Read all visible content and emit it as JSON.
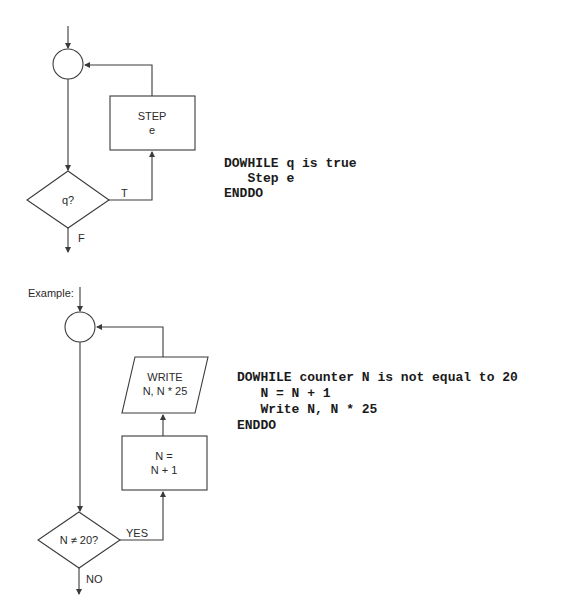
{
  "diagram1": {
    "name": "DOWHILE general form",
    "process_box": {
      "line1": "STEP",
      "line2": "e"
    },
    "decision": {
      "label": "q?",
      "true_label": "T",
      "false_label": "F"
    },
    "pseudocode": [
      "DOWHILE q is true",
      "   Step e",
      "ENDDO"
    ]
  },
  "diagram2": {
    "caption": "Example:",
    "io_box": {
      "line1": "WRITE",
      "line2": "N, N * 25"
    },
    "process_box": {
      "line1": "N =",
      "line2": "N + 1"
    },
    "decision": {
      "label": "N ≠ 20?",
      "true_label": "YES",
      "false_label": "NO"
    },
    "pseudocode": [
      "DOWHILE counter N is not equal to 20",
      "   N = N + 1",
      "   Write N, N * 25",
      "ENDDO"
    ]
  }
}
